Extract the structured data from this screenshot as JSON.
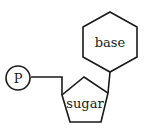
{
  "diagram": {
    "nodes": [
      {
        "id": "phosphate",
        "label": "P",
        "shape": "circle"
      },
      {
        "id": "sugar",
        "label": "sugar",
        "shape": "pentagon"
      },
      {
        "id": "base",
        "label": "base",
        "shape": "hexagon"
      }
    ],
    "edges": [
      {
        "from": "phosphate",
        "to": "sugar"
      },
      {
        "from": "sugar",
        "to": "base"
      }
    ],
    "colors": {
      "stroke": "#1a1a1a",
      "fill": "#ffffff",
      "background": "#ffffff"
    }
  }
}
